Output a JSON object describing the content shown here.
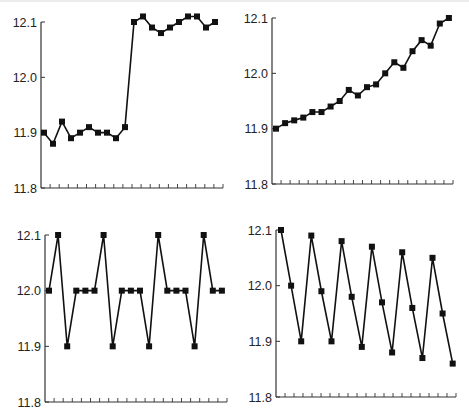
{
  "colors": {
    "line": "#111111",
    "axis": "#333333",
    "background": "#ffffff"
  },
  "chart_data": [
    {
      "type": "line",
      "title": "",
      "xlabel": "",
      "ylabel": "",
      "ylim": [
        11.8,
        12.1
      ],
      "yticks": [
        "12.1",
        "12.0",
        "11.9",
        "11.8"
      ],
      "x_minor_ticks": 20,
      "grid": false,
      "marker": "square",
      "series": [
        {
          "name": "series-1",
          "values": [
            11.9,
            11.88,
            11.92,
            11.89,
            11.9,
            11.91,
            11.9,
            11.9,
            11.89,
            11.91,
            12.1,
            12.11,
            12.09,
            12.08,
            12.09,
            12.1,
            12.11,
            12.11,
            12.09,
            12.1
          ]
        }
      ],
      "layout": {
        "x0": 41,
        "x1": 223,
        "y_top": 22,
        "y_bottom": 188,
        "first_pt": 44,
        "step": 9.0
      }
    },
    {
      "type": "line",
      "title": "",
      "xlabel": "",
      "ylabel": "",
      "ylim": [
        11.8,
        12.1
      ],
      "yticks": [
        "12.1",
        "12.0",
        "11.9",
        "11.8"
      ],
      "x_minor_ticks": 20,
      "grid": false,
      "marker": "square",
      "series": [
        {
          "name": "series-1",
          "values": [
            11.9,
            11.91,
            11.915,
            11.92,
            11.93,
            11.93,
            11.94,
            11.95,
            11.97,
            11.96,
            11.975,
            11.98,
            12.0,
            12.02,
            12.01,
            12.04,
            12.06,
            12.05,
            12.09,
            12.1
          ]
        }
      ],
      "layout": {
        "x0": 272,
        "x1": 453,
        "y_top": 18,
        "y_bottom": 184,
        "first_pt": 276,
        "step": 9.1
      }
    },
    {
      "type": "line",
      "title": "",
      "xlabel": "",
      "ylabel": "",
      "ylim": [
        11.8,
        12.1
      ],
      "yticks": [
        "12.1",
        "12.0",
        "11.9",
        "11.8"
      ],
      "x_minor_ticks": 20,
      "grid": false,
      "marker": "square",
      "series": [
        {
          "name": "series-1",
          "values": [
            12.0,
            12.1,
            11.9,
            12.0,
            12.0,
            12.0,
            12.1,
            11.9,
            12.0,
            12.0,
            12.0,
            11.9,
            12.1,
            12.0,
            12.0,
            12.0,
            11.9,
            12.1,
            12.0,
            12.0
          ]
        }
      ],
      "layout": {
        "x0": 45,
        "x1": 227,
        "y_top": 235,
        "y_bottom": 402,
        "first_pt": 49,
        "step": 9.1
      }
    },
    {
      "type": "line",
      "title": "",
      "xlabel": "",
      "ylabel": "",
      "ylim": [
        11.8,
        12.1
      ],
      "yticks": [
        "12.1",
        "12.0",
        "11.9",
        "11.8"
      ],
      "x_minor_ticks": 20,
      "grid": false,
      "marker": "square",
      "series": [
        {
          "name": "series-1",
          "values": [
            12.1,
            12.0,
            11.9,
            12.09,
            11.99,
            11.9,
            12.08,
            11.98,
            11.89,
            12.07,
            11.97,
            11.88,
            12.06,
            11.96,
            11.87,
            12.05,
            11.95,
            11.86
          ]
        }
      ],
      "layout": {
        "x0": 276,
        "x1": 456,
        "y_top": 230,
        "y_bottom": 397,
        "first_pt": 281,
        "step": 10.1
      }
    }
  ]
}
